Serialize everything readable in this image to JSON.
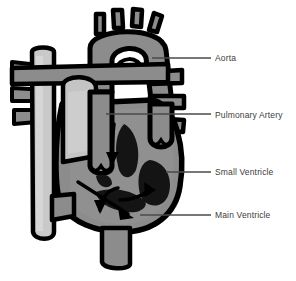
{
  "figure": {
    "kind": "anatomical-diagram",
    "background_color": "#ffffff",
    "outline_color": "#000000",
    "body_fill": "#8c8c8c",
    "vessel_light_fill": "#c9c9c9",
    "chamber_dark_fill": "#111111",
    "leader_line_color": "#4a4a4a",
    "label_text_color": "#3b3b3b"
  },
  "labels": {
    "aorta": "Aorta",
    "pulmonary_artery": "Pulmonary Artery",
    "small_ventricle": "Small Ventricle",
    "main_ventricle": "Main Ventricle"
  },
  "callouts": [
    {
      "id": "aorta",
      "text": "Aorta",
      "leader_from_x": 152,
      "leader_from_y": 58,
      "leader_to_x": 211,
      "leader_to_y": 58
    },
    {
      "id": "pulmonary_artery",
      "text": "Pulmonary Artery",
      "leader_from_x": 106,
      "leader_from_y": 114,
      "leader_to_x": 211,
      "leader_to_y": 114
    },
    {
      "id": "small_ventricle",
      "text": "Small Ventricle",
      "leader_from_x": 166,
      "leader_from_y": 172,
      "leader_to_x": 211,
      "leader_to_y": 172
    },
    {
      "id": "main_ventricle",
      "text": "Main Ventricle",
      "leader_from_x": 140,
      "leader_from_y": 215,
      "leader_to_x": 211,
      "leader_to_y": 215
    }
  ]
}
